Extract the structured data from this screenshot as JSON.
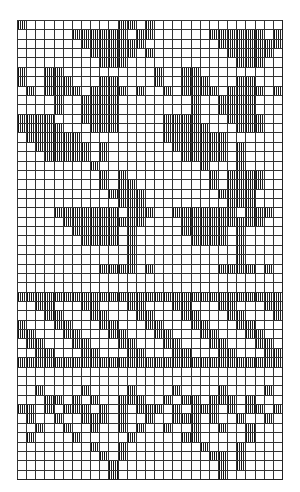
{
  "chart": {
    "name": "knitting-pattern-chart",
    "cols": 29,
    "rows": 49,
    "fill_symbol": "vertical-hatch",
    "colors": {
      "grid": "#333333",
      "fill": "#111111",
      "background": "#ffffff"
    },
    "grid": [
      "#..........##.#..............",
      "......######.##......######.#",
      ".......#######........#######",
      "........#####.#........#####.",
      ".........###............###..",
      "#..##..........#..##.........",
      "#..###...##....#..###...##...",
      ".#.####.####.#..#.####.####.#",
      "....#..####........#..####...",
      "....#..####........#..####...",
      "####...####.....####...####..",
      "#####...###.....#####...###..",
      ".######.........#######......",
      "..######.#.......######.#....",
      "...#####.#........#####.#....",
      "........#...........#...#....",
      ".........#.#.........#.####..",
      ".........#.##........#.####..",
      "..........####........####...",
      "...........###.........###...",
      "....#######.###..#######.###.",
      ".....#########....#########..",
      "......#####.#.....#####.#....",
      ".......####.#......####.#....",
      "............#...........#....",
      "............#...........#....",
      ".........####.#.......####.#.",
      ".............................",
      ".............................",
      "#############################",
      "..##...##...##...##...##...##",
      "...##...##...##...##...##...#",
      "#...##...##...##...##...##...",
      "##...##...##...##...##...##..",
      ".##...##...##...##...##...##.",
      "..##...##...##...##...##...##",
      "#############################",
      ".............................",
      ".............................",
      "..#....#....#....#....#....#.",
      "...##.#.#..###..#.##.###.#...",
      "##.#.###.#.#.###.#.###.#.##.#",
      ".#..#..###.#..#..###.#..#..#.",
      "..#..#..#..#.#..#..#..#..#...",
      ".#....#.....#.....##.....#...",
      "........#..#........#...#....",
      ".........#.#.........##.#....",
      "..........#...........#.#....",
      "..........#...........#......"
    ]
  }
}
